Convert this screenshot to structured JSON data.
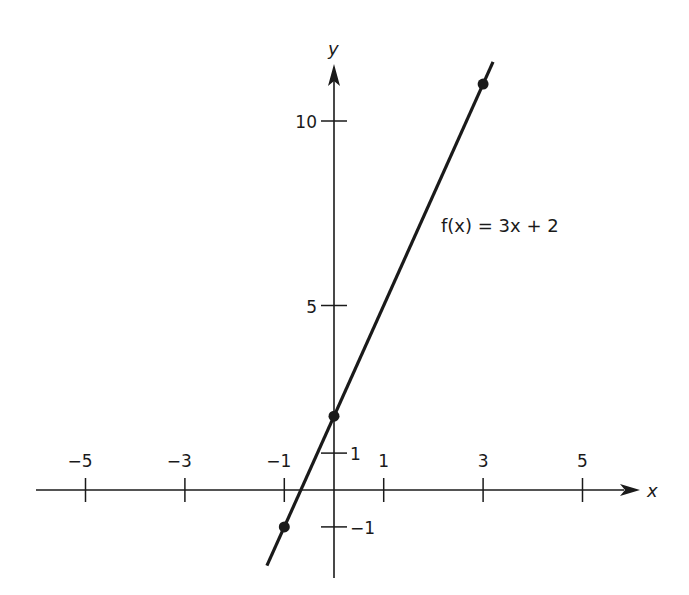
{
  "chart_data": {
    "type": "line",
    "title": "",
    "xlabel": "x",
    "ylabel": "y",
    "xlim": [
      -6,
      6.2
    ],
    "ylim": [
      -2,
      12
    ],
    "grid": false,
    "x_ticks": [
      -5,
      -3,
      -1,
      1,
      3,
      5
    ],
    "x_tick_labels": [
      "−5",
      "−3",
      "−1",
      "1",
      "3",
      "5"
    ],
    "y_ticks": [
      10,
      5,
      1,
      -1
    ],
    "y_tick_labels": [
      "10",
      "5",
      "1",
      "−1"
    ],
    "series": [
      {
        "name": "f(x) = 3x + 2",
        "equation": "f(x) = 3x + 2",
        "slope": 3,
        "intercept": 2,
        "x_range": [
          -1.35,
          3.2
        ],
        "points": [
          {
            "x": -1,
            "y": -1
          },
          {
            "x": 0,
            "y": 2
          },
          {
            "x": 3,
            "y": 11
          }
        ]
      }
    ],
    "annotations": [
      {
        "text": "f(x) = 3x + 2",
        "x": 2.15,
        "y": 7.3
      }
    ]
  },
  "labels": {
    "x_axis": "x",
    "y_axis": "y",
    "function": "f(x) = 3x + 2"
  },
  "colors": {
    "ink": "#1a1a1a",
    "background": "#ffffff"
  }
}
